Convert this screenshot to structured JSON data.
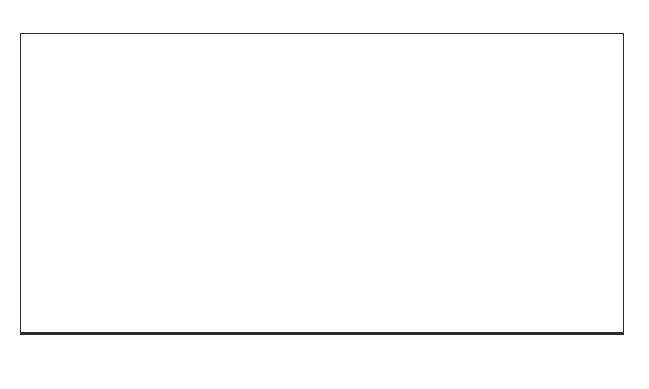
{
  "chart_data": {
    "type": "area",
    "title": "",
    "xlabel": "Years",
    "ylabel": "",
    "xlim": [
      -230,
      820
    ],
    "grid": true,
    "legend": "none",
    "axis": {
      "major_ticks": [
        -200,
        -100,
        0,
        100,
        200,
        300,
        400,
        500,
        600,
        700,
        800
      ],
      "major_tick_labels": [
        "-200",
        "-100",
        "0",
        "100",
        "200",
        "300",
        "400",
        "500",
        "600",
        "700",
        "800"
      ],
      "minor_tick_step": 20,
      "units": "Years"
    },
    "groups": [
      {
        "name": "durations",
        "label": "durations",
        "rows": [
          {
            "label": "duration cremation cemetery",
            "range_start": 5,
            "range_end": 480,
            "dist_start": 130,
            "dist_end": 400,
            "peak": 253,
            "mode_height": 1.0
          },
          {
            "label": "duration barrow",
            "range_start": 5,
            "range_end": 480,
            "dist_start": 150,
            "dist_end": 400,
            "peak": 261,
            "mode_height": 1.0
          },
          {
            "label": "duration pyre hollow",
            "range_start": -5,
            "range_end": 370,
            "dist_start": -2,
            "dist_end": 260,
            "peak": 134,
            "mode_height": 1.0
          },
          {
            "label": "duration Collared Urns",
            "range_start": -5,
            "range_end": 400,
            "dist_start": -2,
            "dist_end": 230,
            "peak": 110,
            "mode_height": 1.0
          }
        ]
      },
      {
        "name": "intervals",
        "label": "intervals",
        "rows": [
          {
            "label": "end Collared Urns/end cremation cemetery",
            "range_start": 40,
            "range_end": 820,
            "dist_start": 42,
            "dist_end": 300,
            "peak": 142,
            "mode_height": 1.0
          },
          {
            "label": "end pyre hollow/end barrow",
            "range_start": -80,
            "range_end": 370,
            "dist_start": -30,
            "dist_end": 205,
            "peak": 60,
            "mode_height": 1.0
          },
          {
            "label": "start barrow/start pyre hollow",
            "range_start": -140,
            "range_end": 340,
            "dist_start": -55,
            "dist_end": 150,
            "peak": 32,
            "mode_height": 1.0
          },
          {
            "label": "start barrow/start western group",
            "range_start": -170,
            "range_end": 370,
            "dist_start": -60,
            "dist_end": 160,
            "peak": 12,
            "mode_height": 1.0
          }
        ]
      }
    ],
    "colors": {
      "distribution_fill": "#000000",
      "frame": "#2b2b2b",
      "gridline": "#6e6e6e",
      "range_line": "#b9b9b9",
      "background": "#ffffff"
    }
  },
  "artifact": {
    "top_text": ""
  }
}
